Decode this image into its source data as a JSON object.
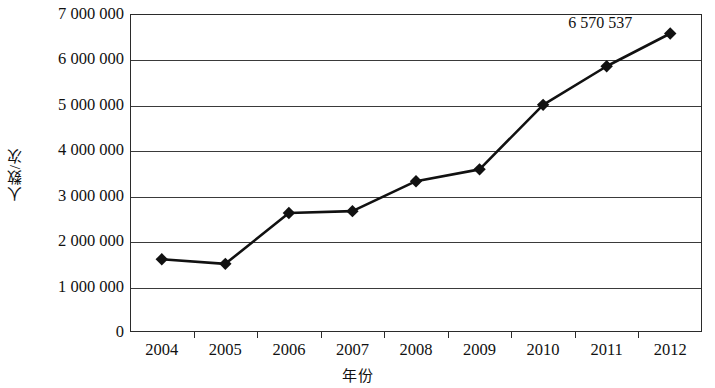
{
  "chart_data": {
    "type": "line",
    "title": "",
    "xlabel": "年份",
    "ylabel": "人数/次",
    "categories": [
      "2004",
      "2005",
      "2006",
      "2007",
      "2008",
      "2009",
      "2010",
      "2011",
      "2012"
    ],
    "values": [
      1600000,
      1500000,
      2620000,
      2660000,
      3320000,
      3580000,
      5000000,
      5850000,
      6570537
    ],
    "ylim": [
      0,
      7000000
    ],
    "ytick_values": [
      0,
      1000000,
      2000000,
      3000000,
      4000000,
      5000000,
      6000000,
      7000000
    ],
    "ytick_labels": [
      "0",
      "1 000 000",
      "2 000 000",
      "3 000 000",
      "4 000 000",
      "5 000 000",
      "6 000 000",
      "7 000 000"
    ],
    "grid": "horizontal",
    "legend": "none",
    "marker": "diamond",
    "series_color": "#111111",
    "grid_color": "#3a3a3a",
    "annotations": [
      {
        "label": "6 570 537",
        "category": "2012",
        "value": 6570537
      }
    ]
  }
}
